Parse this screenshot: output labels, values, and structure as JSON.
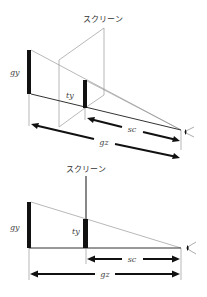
{
  "diagrams": {
    "perspective": {
      "screen_label": "スクリーン",
      "object_height_label": "gy",
      "projected_height_label": "ty",
      "screen_distance_label": "sc",
      "object_distance_label": "gz"
    },
    "side_view": {
      "screen_label": "スクリーン",
      "object_height_label": "gy",
      "projected_height_label": "ty",
      "screen_distance_label": "sc",
      "object_distance_label": "gz"
    }
  },
  "colors": {
    "line_thin": "#888888",
    "line_dark": "#222222",
    "bar": "#111111",
    "text": "#333333"
  },
  "icons": {
    "eye": "eye-icon"
  }
}
